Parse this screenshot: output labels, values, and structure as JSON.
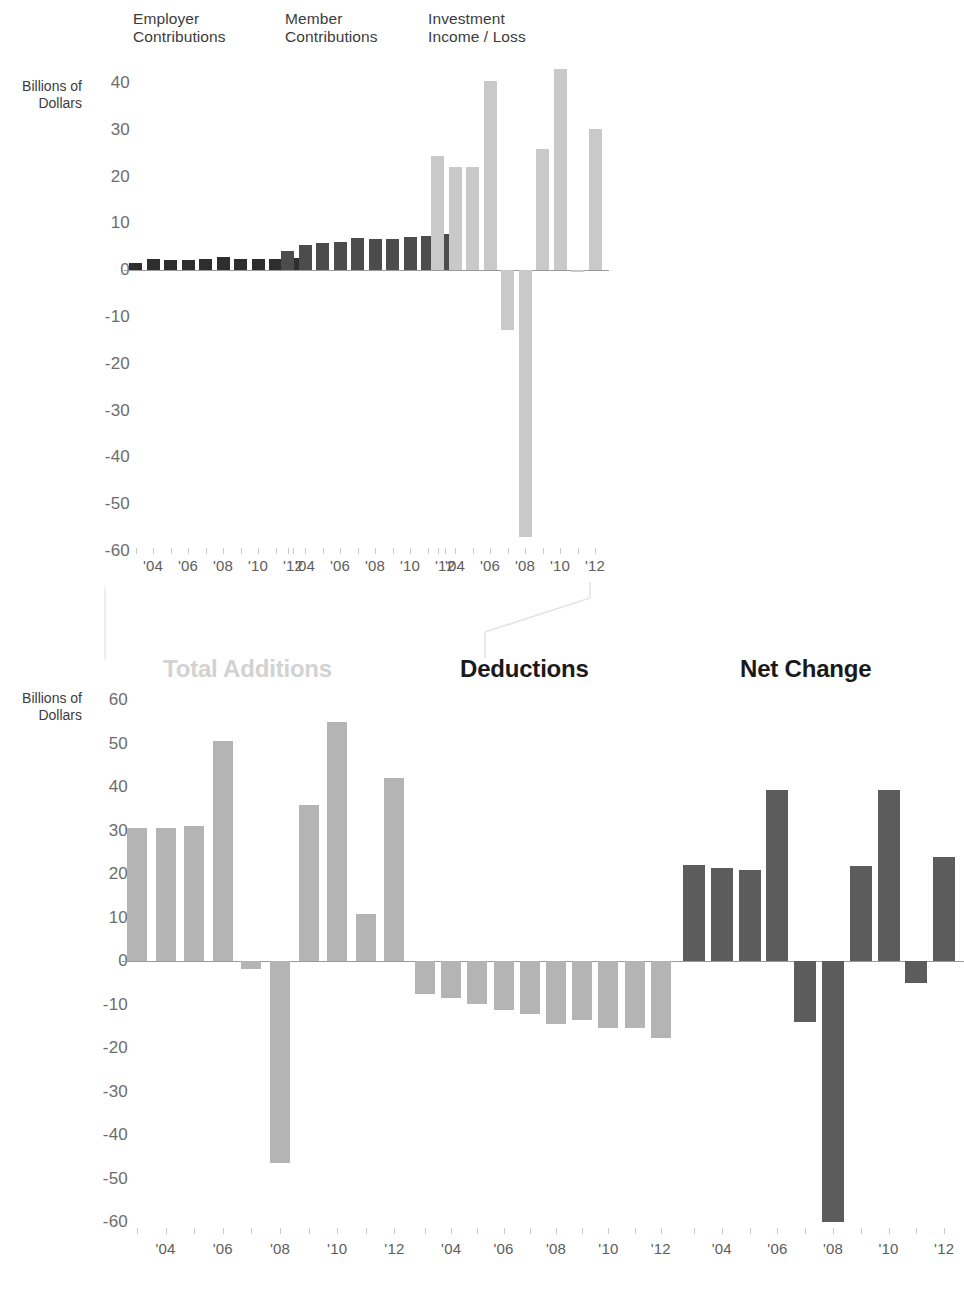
{
  "figure": {
    "axis_caption_top": "Billions of\nDollars",
    "axis_caption_bottom": "Billions of\nDollars"
  },
  "chart_data": [
    {
      "type": "bar",
      "title": "Employer\nContributions",
      "xlabel": "",
      "ylabel": "Billions of Dollars",
      "ylim": [
        -60,
        40
      ],
      "yticks": [
        40,
        30,
        20,
        10,
        0,
        -10,
        -20,
        -30,
        -40,
        -50,
        -60
      ],
      "ytick_labels": [
        "40",
        "30",
        "20",
        "10",
        "0",
        "-10",
        "-20",
        "-30",
        "-40",
        "-50",
        "-60"
      ],
      "categories": [
        "2003",
        "2004",
        "2005",
        "2006",
        "2007",
        "2008",
        "2009",
        "2010",
        "2011",
        "2012"
      ],
      "tick_labels": [
        "'04",
        "'06",
        "'08",
        "'10",
        "'12"
      ],
      "values": [
        1.6,
        2.3,
        2.1,
        2.2,
        2.4,
        2.8,
        2.3,
        2.3,
        2.4,
        2.6
      ],
      "color": "#2e2e2e",
      "grid": false,
      "legend": "none"
    },
    {
      "type": "bar",
      "title": "Member\nContributions",
      "xlabel": "",
      "ylabel": "Billions of Dollars",
      "ylim": [
        -60,
        40
      ],
      "yticks": [
        40,
        30,
        20,
        10,
        0,
        -10,
        -20,
        -30,
        -40,
        -50,
        -60
      ],
      "ytick_labels": [
        "40",
        "30",
        "20",
        "10",
        "0",
        "-10",
        "-20",
        "-30",
        "-40",
        "-50",
        "-60"
      ],
      "categories": [
        "2003",
        "2004",
        "2005",
        "2006",
        "2007",
        "2008",
        "2009",
        "2010",
        "2011",
        "2012"
      ],
      "tick_labels": [
        "'04",
        "'06",
        "'08",
        "'10",
        "'12"
      ],
      "values": [
        4.0,
        5.4,
        5.9,
        6.1,
        6.9,
        6.6,
        6.7,
        7.0,
        7.4,
        7.7
      ],
      "color": "#4c4c4c",
      "grid": false,
      "legend": "none"
    },
    {
      "type": "bar",
      "title": "Investment\nIncome / Loss",
      "xlabel": "",
      "ylabel": "Billions of Dollars",
      "ylim": [
        -60,
        40
      ],
      "yticks": [
        40,
        30,
        20,
        10,
        0,
        -10,
        -20,
        -30,
        -40,
        -50,
        -60
      ],
      "ytick_labels": [
        "40",
        "30",
        "20",
        "10",
        "0",
        "-10",
        "-20",
        "-30",
        "-40",
        "-50",
        "-60"
      ],
      "categories": [
        "2003",
        "2004",
        "2005",
        "2006",
        "2007",
        "2008",
        "2009",
        "2010",
        "2011",
        "2012"
      ],
      "tick_labels": [
        "'04",
        "'06",
        "'08",
        "'10",
        "'12"
      ],
      "values": [
        24.5,
        22.0,
        22.0,
        40.5,
        -12.8,
        -57.0,
        25.8,
        43.0,
        -0.4,
        30.2
      ],
      "color": "#c9c9c9",
      "grid": false,
      "legend": "none"
    },
    {
      "type": "bar",
      "title": "Total Additions",
      "title_muted": true,
      "xlabel": "",
      "ylabel": "Billions of Dollars",
      "ylim": [
        -60,
        60
      ],
      "yticks": [
        60,
        50,
        40,
        30,
        20,
        10,
        0,
        -10,
        -20,
        -30,
        -40,
        -50,
        -60
      ],
      "ytick_labels": [
        "60",
        "50",
        "40",
        "30",
        "20",
        "10",
        "0",
        "-10",
        "-20",
        "-30",
        "-40",
        "-50",
        "-60"
      ],
      "categories": [
        "2003",
        "2004",
        "2005",
        "2006",
        "2007",
        "2008",
        "2009",
        "2010",
        "2011",
        "2012"
      ],
      "tick_labels": [
        "'04",
        "'06",
        "'08",
        "'10",
        "'12"
      ],
      "values": [
        30.6,
        30.6,
        31.0,
        50.5,
        -1.8,
        -46.4,
        35.8,
        55.0,
        10.8,
        42.0
      ],
      "color": "#b4b4b4",
      "grid": false,
      "legend": "none"
    },
    {
      "type": "bar",
      "title": "Deductions",
      "title_muted": false,
      "xlabel": "",
      "ylabel": "Billions of Dollars",
      "ylim": [
        -60,
        60
      ],
      "yticks": [
        60,
        50,
        40,
        30,
        20,
        10,
        0,
        -10,
        -20,
        -30,
        -40,
        -50,
        -60
      ],
      "ytick_labels": [
        "60",
        "50",
        "40",
        "30",
        "20",
        "10",
        "0",
        "-10",
        "-20",
        "-30",
        "-40",
        "-50",
        "-60"
      ],
      "categories": [
        "2003",
        "2004",
        "2005",
        "2006",
        "2007",
        "2008",
        "2009",
        "2010",
        "2011",
        "2012"
      ],
      "tick_labels": [
        "'04",
        "'06",
        "'08",
        "'10",
        "'12"
      ],
      "values": [
        -7.6,
        -8.4,
        -9.9,
        -11.2,
        -12.2,
        -14.4,
        -13.6,
        -15.4,
        -15.4,
        -17.6
      ],
      "color": "#b4b4b4",
      "grid": false,
      "legend": "none"
    },
    {
      "type": "bar",
      "title": "Net Change",
      "title_muted": false,
      "xlabel": "",
      "ylabel": "Billions of Dollars",
      "ylim": [
        -60,
        60
      ],
      "yticks": [
        60,
        50,
        40,
        30,
        20,
        10,
        0,
        -10,
        -20,
        -30,
        -40,
        -50,
        -60
      ],
      "ytick_labels": [
        "60",
        "50",
        "40",
        "30",
        "20",
        "10",
        "0",
        "-10",
        "-20",
        "-30",
        "-40",
        "-50",
        "-60"
      ],
      "categories": [
        "2003",
        "2004",
        "2005",
        "2006",
        "2007",
        "2008",
        "2009",
        "2010",
        "2011",
        "2012"
      ],
      "tick_labels": [
        "'04",
        "'06",
        "'08",
        "'10",
        "'12"
      ],
      "values": [
        22.0,
        21.4,
        21.0,
        39.2,
        -14.0,
        -60.0,
        21.8,
        39.4,
        -5.0,
        24.0
      ],
      "color": "#5c5c5c",
      "grid": false,
      "legend": "none"
    }
  ],
  "layout": {
    "top_row_panels": [
      0,
      1,
      2
    ],
    "bottom_row_panels": [
      3,
      4,
      5
    ],
    "bracket_color": "#e6e6e6"
  }
}
